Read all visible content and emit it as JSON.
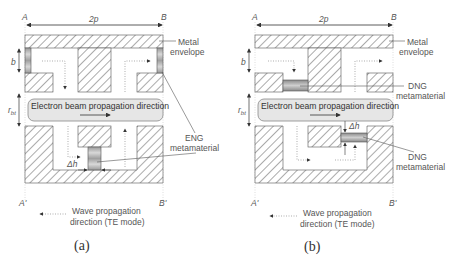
{
  "panels": [
    {
      "id": "a",
      "caption": "(a)",
      "labels": {
        "corner_top_left": "A",
        "corner_top_right": "B",
        "corner_bottom_left": "A'",
        "corner_bottom_right": "B'",
        "period": "2p",
        "slot_depth": "b",
        "beam_radius": "r_bt",
        "beam_radius_main": "r",
        "beam_radius_sub": "bt",
        "delta_h": "Δh",
        "beam_text": "Electron beam propagation direction",
        "metal_line1": "Metal",
        "metal_line2": "envelope",
        "meta_line1": "ENG",
        "meta_line2": "metamaterial",
        "wave_line1": "Wave propagation",
        "wave_line2": "direction (TE mode)"
      },
      "metamaterial_type": "ENG"
    },
    {
      "id": "b",
      "caption": "(b)",
      "labels": {
        "corner_top_left": "A",
        "corner_top_right": "B",
        "corner_bottom_left": "A'",
        "corner_bottom_right": "B'",
        "period": "2p",
        "slot_depth": "b",
        "beam_radius": "r_bt",
        "beam_radius_main": "r",
        "beam_radius_sub": "bt",
        "delta_h": "Δh",
        "beam_text": "Electron beam propagation direction",
        "metal_line1": "Metal",
        "metal_line2": "envelope",
        "meta_top_line1": "DNG",
        "meta_top_line2": "metamaterial",
        "meta_bottom_line1": "DNG",
        "meta_bottom_line2": "metamaterial",
        "wave_line1": "Wave propagation",
        "wave_line2": "direction (TE mode)"
      },
      "metamaterial_type": "DNG"
    }
  ],
  "colors": {
    "hatch": "#6a6a6a",
    "beam_fill": "#e6e6e6",
    "beam_stroke": "#888888",
    "metamaterial_fill": "#b0b0b0",
    "text": "#555555"
  }
}
